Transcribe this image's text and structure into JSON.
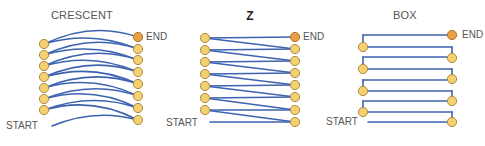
{
  "diagrams": [
    {
      "title": "CRESCENT",
      "start_label": "START",
      "end_label": "END",
      "left_nodes_y": [
        44,
        55,
        66,
        77,
        88,
        99,
        110
      ],
      "right_nodes_y": [
        37,
        49,
        60,
        72,
        84,
        96,
        108,
        120
      ]
    },
    {
      "title": "Z",
      "start_label": "START",
      "end_label": "END",
      "left_nodes_y": [
        38,
        50,
        62,
        74,
        86,
        98,
        110
      ],
      "right_nodes_y": [
        37,
        49,
        61,
        73,
        85,
        97,
        110,
        122
      ]
    },
    {
      "title": "BOX",
      "start_label": "START",
      "end_label": "END",
      "left_nodes_y": [
        47,
        69,
        91,
        112
      ],
      "right_nodes_y": [
        35,
        58,
        79,
        101,
        122
      ]
    }
  ],
  "colors": {
    "line": "#3d63b0",
    "node_fill": "#f3d172",
    "node_stroke": "#b28a3a",
    "end_fill": "#e9a042",
    "end_stroke": "#b0702a",
    "text": "#555555"
  }
}
